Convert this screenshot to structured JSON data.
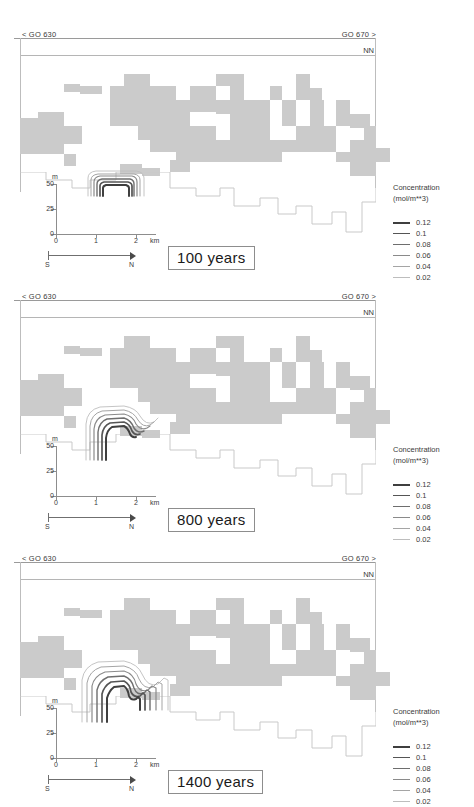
{
  "figure": {
    "type": "contour-cross-section-series",
    "panel_count": 3
  },
  "panels": [
    {
      "title": "100 years",
      "time_value": 100,
      "time_unit": "years",
      "header_left": "< GO 630",
      "header_right": "GO 670 >",
      "datum_label": "NN"
    },
    {
      "title": "800 years",
      "time_value": 800,
      "time_unit": "years",
      "header_left": "< GO 630",
      "header_right": "GO 670 >",
      "datum_label": "NN"
    },
    {
      "title": "1400 years",
      "time_value": 1400,
      "time_unit": "years",
      "header_left": "< GO 630",
      "header_right": "GO 670 >",
      "datum_label": "NN"
    }
  ],
  "axes": {
    "y_unit": "m",
    "y_ticks": [
      "50",
      "25",
      "0"
    ],
    "y_values": [
      50,
      25,
      0
    ],
    "x_ticks": [
      "0",
      "1",
      "2"
    ],
    "x_values": [
      0,
      1,
      2
    ],
    "x_unit": "km"
  },
  "compass": {
    "start_label": "S",
    "end_label": "N"
  },
  "legend": {
    "title_line1": "Concentration",
    "title_line2": "(mol/m**3)",
    "entries": [
      {
        "value": "0.12",
        "num": 0.12,
        "color": "#3f3f3f",
        "weight": 2.0
      },
      {
        "value": "0.1",
        "num": 0.1,
        "color": "#555555",
        "weight": 1.7
      },
      {
        "value": "0.08",
        "num": 0.08,
        "color": "#6e6e6e",
        "weight": 1.4
      },
      {
        "value": "0.06",
        "num": 0.06,
        "color": "#8a8a8a",
        "weight": 1.2
      },
      {
        "value": "0.04",
        "num": 0.04,
        "color": "#a5a5a5",
        "weight": 1.0
      },
      {
        "value": "0.02",
        "num": 0.02,
        "color": "#bdbdbd",
        "weight": 0.9
      }
    ]
  },
  "chart_data": {
    "type": "contour",
    "xlabel": "km",
    "ylabel": "m",
    "xlim": [
      0,
      2.4
    ],
    "ylim": [
      0,
      55
    ],
    "grid": false,
    "legend_position": "right",
    "contour_levels": [
      0.02,
      0.04,
      0.06,
      0.08,
      0.1,
      0.12
    ],
    "level_unit": "mol/m**3",
    "series": [
      {
        "name": "100 years",
        "plume_x_range_km": [
          1.45,
          2.15
        ],
        "plume_height_m": 14,
        "description": "narrow flat-topped plume, contours tightly nested",
        "max_level": 0.12
      },
      {
        "name": "800 years",
        "plume_x_range_km": [
          1.3,
          2.2
        ],
        "plume_height_m": 36,
        "description": "tall plume with several nested contour bands rising above source",
        "max_level": 0.12
      },
      {
        "name": "1400 years",
        "plume_x_range_km": [
          1.2,
          2.35
        ],
        "plume_height_m": 42,
        "description": "widest plume, outer low-concentration contours spread downstream",
        "max_level": 0.12
      }
    ],
    "strata_color": "#cbcbcb",
    "background_color": "#ffffff"
  }
}
